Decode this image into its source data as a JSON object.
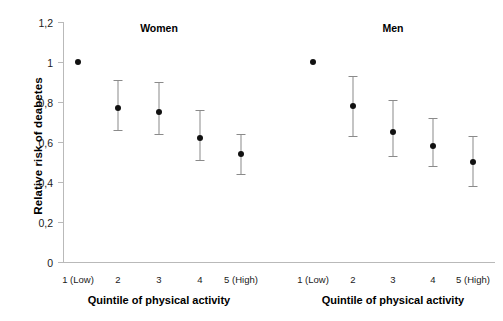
{
  "chart_data": {
    "type": "scatter",
    "title": "",
    "xlabel": "Quintile of physical activity",
    "ylabel": "Relative risk of deabetes",
    "ylim": [
      0,
      1.2
    ],
    "yticks": [
      "0",
      "0,2",
      "0,4",
      "0,6",
      "0,8",
      "1",
      "1,2"
    ],
    "ytick_values": [
      0,
      0.2,
      0.4,
      0.6,
      0.8,
      1.0,
      1.2
    ],
    "categories": [
      "1 (Low)",
      "2",
      "3",
      "4",
      "5 (High)"
    ],
    "grid": false,
    "legend": "none",
    "panels": [
      {
        "name": "Women",
        "xlabel": "Quintile of physical activity",
        "categories": [
          "1 (Low)",
          "2",
          "3",
          "4",
          "5 (High)"
        ],
        "values": [
          1.0,
          0.77,
          0.75,
          0.62,
          0.54
        ],
        "ci_low": [
          1.0,
          0.66,
          0.64,
          0.51,
          0.44
        ],
        "ci_high": [
          1.0,
          0.91,
          0.9,
          0.76,
          0.64
        ]
      },
      {
        "name": "Men",
        "xlabel": "Quintile of physical activity",
        "categories": [
          "1 (Low)",
          "2",
          "3",
          "4",
          "5 (High)"
        ],
        "values": [
          1.0,
          0.78,
          0.65,
          0.58,
          0.5
        ],
        "ci_low": [
          1.0,
          0.63,
          0.53,
          0.48,
          0.38
        ],
        "ci_high": [
          1.0,
          0.93,
          0.81,
          0.72,
          0.63
        ]
      }
    ]
  },
  "axes": {
    "y_title": "Relative risk of deabetes",
    "x_title": "Quintile of physical activity"
  },
  "panel_titles": {
    "women": "Women",
    "men": "Men"
  },
  "colors": {
    "point": "#111111",
    "errorbar": "#8a8a8a",
    "axis": "#b9b9b9",
    "text": "#000000",
    "background": "#ffffff"
  }
}
